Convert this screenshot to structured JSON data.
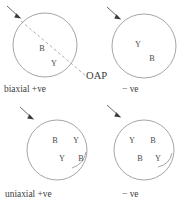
{
  "figure": {
    "title_visible": false,
    "background_color": "#ffffff",
    "outline_color": "#8e8e8e",
    "text_color": "#3d3d3d",
    "oap": {
      "label": "OAP",
      "style": "dashed"
    },
    "panels": [
      {
        "id": "biaxial-positive",
        "position": "top-left",
        "caption": "biaxial +ve",
        "arrow": {
          "name": "incident-light-arrow",
          "visible": true
        },
        "oap_line": true,
        "letters": [
          {
            "text": "B",
            "x": 42,
            "y": 51
          },
          {
            "text": "Y",
            "x": 54,
            "y": 66
          }
        ]
      },
      {
        "id": "biaxial-negative",
        "position": "top-right",
        "caption": "− ve",
        "arrow": {
          "name": "incident-light-arrow",
          "visible": true
        },
        "oap_line": false,
        "letters": [
          {
            "text": "Y",
            "x": 138,
            "y": 47
          },
          {
            "text": "B",
            "x": 152,
            "y": 61
          }
        ]
      },
      {
        "id": "uniaxial-positive",
        "position": "bottom-left",
        "caption": "uniaxial +ve",
        "arrow": {
          "name": "incident-light-arrow",
          "visible": true
        },
        "oap_line": false,
        "letters": [
          {
            "text": "B",
            "x": 55,
            "y": 143
          },
          {
            "text": "Y",
            "x": 76,
            "y": 143
          },
          {
            "text": "Y",
            "x": 62,
            "y": 161
          },
          {
            "text": "B",
            "x": 81,
            "y": 161
          }
        ]
      },
      {
        "id": "uniaxial-negative",
        "position": "bottom-right",
        "caption": "− ve",
        "arrow": {
          "name": "incident-light-arrow",
          "visible": true
        },
        "oap_line": false,
        "letters": [
          {
            "text": "Y",
            "x": 132,
            "y": 143
          },
          {
            "text": "B",
            "x": 153,
            "y": 143
          },
          {
            "text": "B",
            "x": 140,
            "y": 161
          },
          {
            "text": "Y",
            "x": 158,
            "y": 161
          }
        ]
      }
    ],
    "captions": {
      "biaxial_positive": "biaxial +ve",
      "biaxial_negative": "− ve",
      "uniaxial_positive": "uniaxial +ve",
      "uniaxial_negative": "− ve"
    }
  }
}
